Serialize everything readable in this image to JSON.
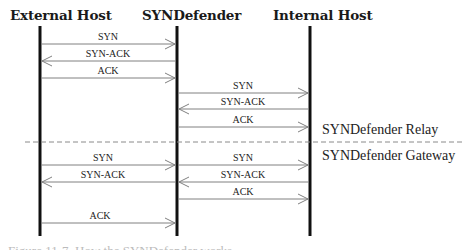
{
  "diagram": {
    "type": "sequence-diagram",
    "participants": [
      {
        "id": "external",
        "label": "External Host",
        "x": 40
      },
      {
        "id": "syndefender",
        "label": "SYNDefender",
        "x": 177
      },
      {
        "id": "internal",
        "label": "Internal Host",
        "x": 310
      }
    ],
    "sections": [
      {
        "name": "SYNDefender Relay",
        "messages": [
          {
            "label": "SYN",
            "from": "external",
            "to": "syndefender"
          },
          {
            "label": "SYN-ACK",
            "from": "syndefender",
            "to": "external"
          },
          {
            "label": "ACK",
            "from": "external",
            "to": "syndefender"
          },
          {
            "label": "SYN",
            "from": "syndefender",
            "to": "internal"
          },
          {
            "label": "SYN-ACK",
            "from": "internal",
            "to": "syndefender"
          },
          {
            "label": "ACK",
            "from": "syndefender",
            "to": "internal"
          }
        ]
      },
      {
        "name": "SYNDefender Gateway",
        "messages": [
          {
            "label": "SYN",
            "from": "external",
            "to": "syndefender"
          },
          {
            "label": "SYN",
            "from": "syndefender",
            "to": "internal"
          },
          {
            "label": "SYN-ACK",
            "from": "syndefender",
            "to": "external"
          },
          {
            "label": "SYN-ACK",
            "from": "internal",
            "to": "syndefender"
          },
          {
            "label": "ACK",
            "from": "syndefender",
            "to": "internal"
          },
          {
            "label": "ACK",
            "from": "external",
            "to": "syndefender"
          }
        ]
      }
    ]
  },
  "headers": {
    "external": "External Host",
    "syndefender": "SYNDefender",
    "internal": "Internal Host"
  },
  "labels": {
    "relay": {
      "m1": "SYN",
      "m2": "SYN-ACK",
      "m3": "ACK",
      "m4": "SYN",
      "m5": "SYN-ACK",
      "m6": "ACK"
    },
    "gateway": {
      "m1": "SYN",
      "m2": "SYN",
      "m3": "SYN-ACK",
      "m4": "SYN-ACK",
      "m5": "ACK",
      "m6": "ACK"
    }
  },
  "notes": {
    "relay": "SYNDefender Relay",
    "gateway": "SYNDefender Gateway"
  },
  "caption": "Figure 11-7. How the SYNDefender works",
  "colors": {
    "lifeline": "#111111",
    "arrow": "#808080",
    "separator": "#8a8a8a",
    "text": "#222222"
  }
}
